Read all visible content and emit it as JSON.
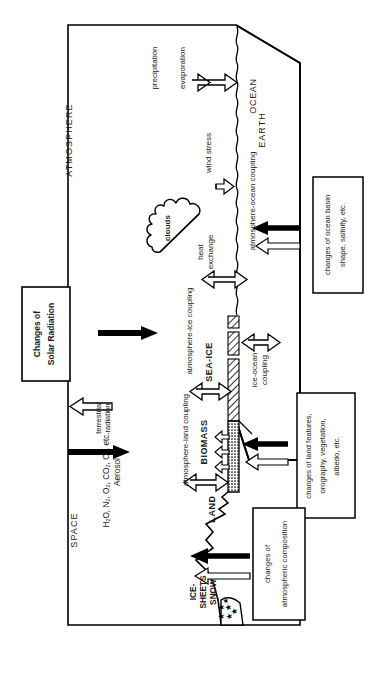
{
  "diagram": {
    "domains": {
      "space": "SPACE",
      "atmosphere": "ATMOSPHERE",
      "earth": "EARTH",
      "ocean": "OCEAN",
      "land": "LAND",
      "biomass": "BIOMASS",
      "sea_ice": "SEA-ICE",
      "ice_sheets": "ICE-",
      "ice_sheets2": "SHEETS",
      "snow": "SNOW",
      "clouds": "clouds"
    },
    "flux_labels": {
      "terrestrial_radiation_1": "terrestrial",
      "terrestrial_radiation_2": "radiation",
      "atmospheric_constituents": "H₂O, N₂, O₂, CO₂, O₃, etc.",
      "aerosol": "Aerosol",
      "precipitation": "precipitation",
      "evaporation": "evaporation",
      "wind_stress": "wind stress",
      "heat_exchange_1": "heat",
      "heat_exchange_2": "exchange",
      "atmosphere_land_coupling": "atmosphere-land coupling",
      "atmosphere_ice_coupling": "atmosphere-ice coupling",
      "ice_ocean_coupling_1": "ice-ocean",
      "ice_ocean_coupling_2": "coupling",
      "atmosphere_ocean_coupling": "atmosphere-ocean coupling"
    },
    "forcing_boxes": [
      {
        "id": "solar-radiation",
        "line1": "Changes of",
        "line2": "Solar Radiation"
      },
      {
        "id": "ocean-basin",
        "line1": "changes of ocean basin",
        "line2": "shape, salinity, etc."
      },
      {
        "id": "land-features",
        "line1": "changes of land features,",
        "line2": "orography, vegetation,",
        "line3": "albedo, etc."
      },
      {
        "id": "atmospheric-composition",
        "line1": "changes of",
        "line2": "atmospheric composition"
      }
    ],
    "colors": {
      "stroke": "#000000",
      "background": "#ffffff",
      "text": "#1a1a1a",
      "hatch": "#555555"
    }
  }
}
